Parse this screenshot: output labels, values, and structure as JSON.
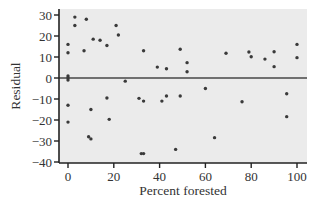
{
  "chart_data": {
    "type": "scatter",
    "title": "",
    "xlabel": "Percent forested",
    "ylabel": "Residual",
    "xlim": [
      -4,
      104
    ],
    "ylim": [
      -40,
      33
    ],
    "xticks": [
      0,
      20,
      40,
      60,
      80,
      100
    ],
    "yticks": [
      -40,
      -30,
      -20,
      -10,
      0,
      10,
      20,
      30
    ],
    "xtick_labels": [
      "0",
      "20",
      "40",
      "60",
      "80",
      "100"
    ],
    "ytick_labels": [
      "−40",
      "−30",
      "−20",
      "−10",
      "0",
      "10",
      "20",
      "30"
    ],
    "grid": false,
    "legend": null,
    "reference_line": {
      "y": 0,
      "color": "#707070"
    },
    "colors": {
      "background": "#ebebeb",
      "point": "#3a3a3a",
      "axis": "#222222"
    },
    "points": [
      {
        "x": 0,
        "y": 16
      },
      {
        "x": 0,
        "y": 12
      },
      {
        "x": 0,
        "y": 1
      },
      {
        "x": 0,
        "y": 0
      },
      {
        "x": 0,
        "y": -1
      },
      {
        "x": 0,
        "y": -13
      },
      {
        "x": 0,
        "y": -21
      },
      {
        "x": 3,
        "y": 29
      },
      {
        "x": 3,
        "y": 25
      },
      {
        "x": 7,
        "y": 13
      },
      {
        "x": 8,
        "y": 28
      },
      {
        "x": 9,
        "y": -28
      },
      {
        "x": 10,
        "y": -29
      },
      {
        "x": 10,
        "y": -15
      },
      {
        "x": 11,
        "y": 18.5
      },
      {
        "x": 14,
        "y": 18
      },
      {
        "x": 17,
        "y": 15.5
      },
      {
        "x": 17,
        "y": -9.5
      },
      {
        "x": 18,
        "y": -19.7
      },
      {
        "x": 21,
        "y": 25
      },
      {
        "x": 22,
        "y": 20.5
      },
      {
        "x": 25,
        "y": -1.5
      },
      {
        "x": 31,
        "y": -9.7
      },
      {
        "x": 32,
        "y": -36
      },
      {
        "x": 33,
        "y": -36
      },
      {
        "x": 33,
        "y": 13
      },
      {
        "x": 33,
        "y": -11
      },
      {
        "x": 39,
        "y": 5.2
      },
      {
        "x": 41,
        "y": -11
      },
      {
        "x": 43,
        "y": 4.4
      },
      {
        "x": 43,
        "y": -8.6
      },
      {
        "x": 47,
        "y": -34
      },
      {
        "x": 49,
        "y": 13.7
      },
      {
        "x": 49,
        "y": -8.6
      },
      {
        "x": 52,
        "y": 7.3
      },
      {
        "x": 52,
        "y": 3
      },
      {
        "x": 60,
        "y": -5
      },
      {
        "x": 64,
        "y": -28.4
      },
      {
        "x": 69,
        "y": 11.8
      },
      {
        "x": 76,
        "y": -11.3
      },
      {
        "x": 79,
        "y": 12.4
      },
      {
        "x": 80,
        "y": 10.1
      },
      {
        "x": 86,
        "y": 9
      },
      {
        "x": 90,
        "y": 12.5
      },
      {
        "x": 90,
        "y": 5.4
      },
      {
        "x": 95.5,
        "y": -7.5
      },
      {
        "x": 95.5,
        "y": -18.4
      },
      {
        "x": 100,
        "y": 16
      },
      {
        "x": 100,
        "y": 9.7
      }
    ]
  }
}
